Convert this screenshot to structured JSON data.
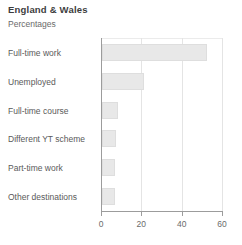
{
  "header": {
    "title": "England & Wales",
    "subtitle": "Percentages"
  },
  "chart_data": {
    "type": "bar",
    "orientation": "horizontal",
    "title": "England & Wales",
    "subtitle": "Percentages",
    "xlabel": "",
    "ylabel": "",
    "xlim": [
      0,
      60
    ],
    "xticks": [
      0,
      20,
      40,
      60
    ],
    "xtick_labels": [
      "0",
      "20",
      "40",
      "60"
    ],
    "grid": true,
    "grid_axis": "x",
    "legend": false,
    "bar_color": "#e8e8e8",
    "bar_border_color": "#dedede",
    "axis_color": "#9c9c9c",
    "text_color": "#5a5a5a",
    "title_color": "#3d3d3d",
    "categories": [
      "Full-time work",
      "Unemployed",
      "Full-time course",
      "Different YT scheme",
      "Part-time work",
      "Other destinations"
    ],
    "values": [
      52,
      21,
      8,
      7,
      6.5,
      6.5
    ]
  }
}
